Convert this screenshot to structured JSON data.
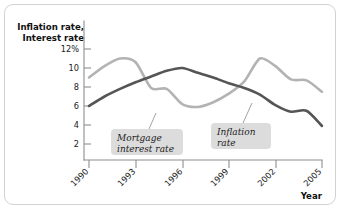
{
  "figure": {
    "background_color": "#ffffff",
    "border_color": "#d2d2d2"
  },
  "chart_data": {
    "type": "line",
    "title": "",
    "subtitle": "",
    "ylabel_line1": "Inflation rate,",
    "ylabel_line2": "Interest rate",
    "xlabel": "Year",
    "ylabel": "Inflation rate, Interest rate",
    "grid": false,
    "legend_position": "inline-annotations",
    "xlim": [
      1990,
      2005
    ],
    "ylim": [
      0,
      12
    ],
    "xticks": [
      1990,
      1993,
      1996,
      1999,
      2002,
      2005
    ],
    "xtick_labels": [
      "1990",
      "1993",
      "1996",
      "1999",
      "2002",
      "2005"
    ],
    "yticks": [
      2,
      4,
      6,
      8,
      10,
      12
    ],
    "ytick_labels": [
      "2",
      "4",
      "6",
      "8",
      "10",
      "12%"
    ],
    "x": [
      1990,
      1991,
      1992,
      1993,
      1994,
      1995,
      1996,
      1997,
      1998,
      1999,
      2000,
      2001,
      2002,
      2003,
      2004,
      2005
    ],
    "series": [
      {
        "name": "Mortgage interest rate",
        "color": "#b3b3b3",
        "width": 2.6,
        "values": [
          9.0,
          10.2,
          11.0,
          10.6,
          7.9,
          7.8,
          6.2,
          5.9,
          6.4,
          7.3,
          8.6,
          11.0,
          10.2,
          8.8,
          8.7,
          7.5
        ]
      },
      {
        "name": "Inflation rate",
        "color": "#555555",
        "width": 2.6,
        "values": [
          6.0,
          7.0,
          7.8,
          8.5,
          9.1,
          9.7,
          10.0,
          9.5,
          9.0,
          8.4,
          7.9,
          7.2,
          6.1,
          5.4,
          5.5,
          3.9
        ]
      }
    ],
    "annotations": [
      {
        "label_line1": "Mortgage",
        "label_line2": "interest rate",
        "target_series": "Mortgage interest rate"
      },
      {
        "label_line1": "Inflation",
        "label_line2": "rate",
        "target_series": "Inflation rate"
      }
    ]
  }
}
